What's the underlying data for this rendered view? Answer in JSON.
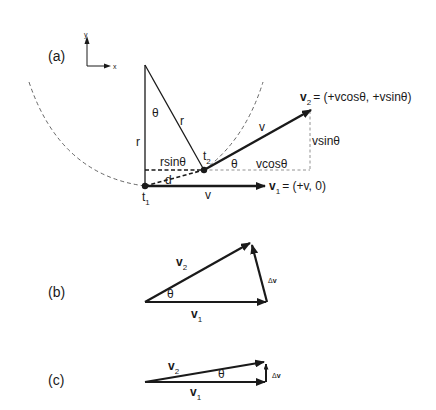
{
  "panels": {
    "a": {
      "label": "(a)",
      "axes": {
        "y": "y",
        "x": "x"
      },
      "theta": "θ",
      "r_left": "r",
      "r_hyp": "r",
      "rsin": "rsinθ",
      "d": "d",
      "t1": "t",
      "t1_sub": "1",
      "t2": "t",
      "t2_sub": "2",
      "v_label_2": "v",
      "theta_2": "θ",
      "vcos": "vcosθ",
      "vsin": "vsinθ",
      "v_label_1": "v",
      "v2_name": "v",
      "v2_sub": "2",
      "v2_eq": "= (+vcosθ, +vsinθ)",
      "v1_name": "v",
      "v1_sub": "1",
      "v1_eq": "= (+v, 0)"
    },
    "b": {
      "label": "(b)",
      "v2_name": "v",
      "v2_sub": "2",
      "v1_name": "v",
      "v1_sub": "1",
      "theta": "θ",
      "dv_delta": "Δ",
      "dv_v": "v"
    },
    "c": {
      "label": "(c)",
      "v2_name": "v",
      "v2_sub": "2",
      "v1_name": "v",
      "v1_sub": "1",
      "theta": "θ",
      "dv_delta": "Δ",
      "dv_v": "v"
    }
  },
  "colors": {
    "ink": "#1a1a1a",
    "dash": "#555555",
    "background": "#ffffff"
  }
}
